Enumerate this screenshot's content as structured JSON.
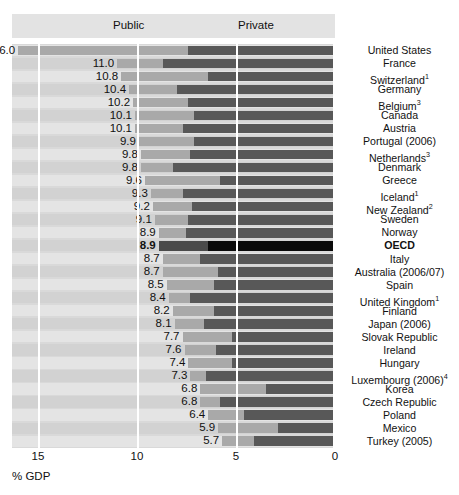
{
  "legend": {
    "public": {
      "label": "Public",
      "color": "#585858"
    },
    "private": {
      "label": "Private",
      "color": "#a9a9a9"
    }
  },
  "axis": {
    "title": "% GDP",
    "ticks": [
      "15",
      "10",
      "5",
      "0"
    ]
  },
  "chart_data": {
    "type": "bar",
    "orientation": "horizontal-reversed",
    "title": "",
    "xlabel": "% GDP",
    "ylabel": "",
    "xlim": [
      0,
      16.5
    ],
    "axis_ticks": [
      15,
      10,
      5,
      0
    ],
    "axis_direction": "right-to-left",
    "grid": true,
    "legend_position": "top",
    "stacked": true,
    "series": [
      {
        "name": "Public",
        "color": "#585858"
      },
      {
        "name": "Private",
        "color": "#a9a9a9"
      }
    ],
    "categories": [
      "United States",
      "France",
      "Switzerland",
      "Germany",
      "Belgium",
      "Canada",
      "Austria",
      "Portugal (2006)",
      "Netherlands",
      "Denmark",
      "Greece",
      "Iceland",
      "New Zealand",
      "Sweden",
      "Norway",
      "OECD",
      "Italy",
      "Australia (2006/07)",
      "Spain",
      "United Kingdom",
      "Finland",
      "Japan (2006)",
      "Slovak Republic",
      "Ireland",
      "Hungary",
      "Luxembourg (2006)",
      "Korea",
      "Czech Republic",
      "Poland",
      "Mexico",
      "Turkey (2005)"
    ],
    "rows": [
      {
        "label": "United States",
        "sup": "",
        "total": "16.0",
        "value": 16.0,
        "public": 7.4,
        "private": 8.6,
        "highlight": false
      },
      {
        "label": "France",
        "sup": "",
        "total": "11.0",
        "value": 11.0,
        "public": 8.7,
        "private": 2.3,
        "highlight": false
      },
      {
        "label": "Switzerland",
        "sup": "1",
        "total": "10.8",
        "value": 10.8,
        "public": 6.4,
        "private": 4.4,
        "highlight": false
      },
      {
        "label": "Germany",
        "sup": "",
        "total": "10.4",
        "value": 10.4,
        "public": 8.0,
        "private": 2.4,
        "highlight": false
      },
      {
        "label": "Belgium",
        "sup": "3",
        "total": "10.2",
        "value": 10.2,
        "public": 7.4,
        "private": 2.8,
        "highlight": false
      },
      {
        "label": "Canada",
        "sup": "",
        "total": "10.1",
        "value": 10.1,
        "public": 7.1,
        "private": 3.0,
        "highlight": false
      },
      {
        "label": "Austria",
        "sup": "",
        "total": "10.1",
        "value": 10.1,
        "public": 7.7,
        "private": 2.4,
        "highlight": false
      },
      {
        "label": "Portugal (2006)",
        "sup": "",
        "total": "9.9",
        "value": 9.9,
        "public": 7.1,
        "private": 2.8,
        "highlight": false
      },
      {
        "label": "Netherlands",
        "sup": "3",
        "total": "9.8",
        "value": 9.8,
        "public": 7.3,
        "private": 2.5,
        "highlight": false
      },
      {
        "label": "Denmark",
        "sup": "",
        "total": "9.8",
        "value": 9.8,
        "public": 8.2,
        "private": 1.6,
        "highlight": false
      },
      {
        "label": "Greece",
        "sup": "",
        "total": "9.6",
        "value": 9.6,
        "public": 5.8,
        "private": 3.8,
        "highlight": false
      },
      {
        "label": "Iceland",
        "sup": "1",
        "total": "9.3",
        "value": 9.3,
        "public": 7.7,
        "private": 1.6,
        "highlight": false
      },
      {
        "label": "New Zealand",
        "sup": "2",
        "total": "9.2",
        "value": 9.2,
        "public": 7.2,
        "private": 2.0,
        "highlight": false
      },
      {
        "label": "Sweden",
        "sup": "",
        "total": "9.1",
        "value": 9.1,
        "public": 7.4,
        "private": 1.7,
        "highlight": false
      },
      {
        "label": "Norway",
        "sup": "",
        "total": "8.9",
        "value": 8.9,
        "public": 7.5,
        "private": 1.4,
        "highlight": false
      },
      {
        "label": "OECD",
        "sup": "",
        "total": "8.9",
        "value": 8.9,
        "public": 6.4,
        "private": 2.5,
        "highlight": true
      },
      {
        "label": "Italy",
        "sup": "",
        "total": "8.7",
        "value": 8.7,
        "public": 6.8,
        "private": 1.9,
        "highlight": false
      },
      {
        "label": "Australia (2006/07)",
        "sup": "",
        "total": "8.7",
        "value": 8.7,
        "public": 5.9,
        "private": 2.8,
        "highlight": false
      },
      {
        "label": "Spain",
        "sup": "",
        "total": "8.5",
        "value": 8.5,
        "public": 6.1,
        "private": 2.4,
        "highlight": false
      },
      {
        "label": "United Kingdom",
        "sup": "1",
        "total": "8.4",
        "value": 8.4,
        "public": 7.3,
        "private": 1.1,
        "highlight": false
      },
      {
        "label": "Finland",
        "sup": "",
        "total": "8.2",
        "value": 8.2,
        "public": 6.1,
        "private": 2.1,
        "highlight": false
      },
      {
        "label": "Japan (2006)",
        "sup": "",
        "total": "8.1",
        "value": 8.1,
        "public": 6.6,
        "private": 1.5,
        "highlight": false
      },
      {
        "label": "Slovak Republic",
        "sup": "",
        "total": "7.7",
        "value": 7.7,
        "public": 5.2,
        "private": 2.5,
        "highlight": false
      },
      {
        "label": "Ireland",
        "sup": "",
        "total": "7.6",
        "value": 7.6,
        "public": 6.0,
        "private": 1.6,
        "highlight": false
      },
      {
        "label": "Hungary",
        "sup": "",
        "total": "7.4",
        "value": 7.4,
        "public": 5.2,
        "private": 2.2,
        "highlight": false
      },
      {
        "label": "Luxembourg (2006)",
        "sup": "4",
        "total": "7.3",
        "value": 7.3,
        "public": 6.5,
        "private": 0.8,
        "highlight": false
      },
      {
        "label": "Korea",
        "sup": "",
        "total": "6.8",
        "value": 6.8,
        "public": 3.5,
        "private": 3.3,
        "highlight": false
      },
      {
        "label": "Czech Republic",
        "sup": "",
        "total": "6.8",
        "value": 6.8,
        "public": 5.8,
        "private": 1.0,
        "highlight": false
      },
      {
        "label": "Poland",
        "sup": "",
        "total": "6.4",
        "value": 6.4,
        "public": 4.6,
        "private": 1.8,
        "highlight": false
      },
      {
        "label": "Mexico",
        "sup": "",
        "total": "5.9",
        "value": 5.9,
        "public": 2.9,
        "private": 3.0,
        "highlight": false
      },
      {
        "label": "Turkey (2005)",
        "sup": "",
        "total": "5.7",
        "value": 5.7,
        "public": 4.1,
        "private": 1.6,
        "highlight": false
      }
    ]
  }
}
